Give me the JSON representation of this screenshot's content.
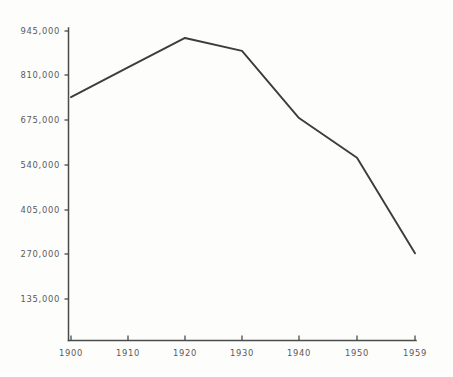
{
  "chart_data": {
    "type": "line",
    "title": "",
    "subtitle": "",
    "xlabel": "",
    "ylabel": "",
    "x": [
      1900,
      1910,
      1920,
      1930,
      1940,
      1950,
      1959
    ],
    "xtick_labels": [
      "1900",
      "1910",
      "1920",
      "1930",
      "1940",
      "1950",
      "1959"
    ],
    "ytick_labels": [
      "135,000",
      "270,000",
      "405,000",
      "540,000",
      "675,000",
      "810,000",
      "945,000"
    ],
    "ytick_values": [
      135000,
      270000,
      405000,
      540000,
      675000,
      810000,
      945000
    ],
    "values": [
      745000,
      835000,
      924000,
      885000,
      682000,
      562000,
      273000
    ],
    "series": [
      {
        "name": "",
        "values": [
          745000,
          835000,
          924000,
          885000,
          682000,
          562000,
          273000
        ]
      }
    ],
    "xlim": [
      1896,
      1962
    ],
    "ylim": [
      0,
      990000
    ],
    "grid": false,
    "legend": false,
    "legend_position": "none",
    "line_color": "#3c3c3c",
    "axis_color": "#4b4b4b",
    "background_color": "#fdfdfc",
    "annotations": []
  },
  "axes": {
    "y_axis_name": "y-axis",
    "x_axis_name": "x-axis"
  }
}
